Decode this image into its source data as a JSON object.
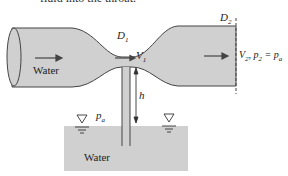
{
  "caption_clip": "fluid into the throat.",
  "labels": {
    "water_pipe": "Water",
    "water_tank": "Water",
    "d1": "D",
    "d1_sub": "1",
    "d2": "D",
    "d2_sub": "2",
    "v1": "V",
    "v1_sub": "1",
    "h": "h",
    "pa": "p",
    "pa_sub": "a",
    "exit_v": "V",
    "exit_v_sub": "2",
    "exit_p": ", p",
    "exit_p_sub": "2",
    "exit_eq": " = p",
    "exit_eq_sub": "a"
  },
  "colors": {
    "fluid": "#d0d0d0",
    "outline": "#444444"
  }
}
